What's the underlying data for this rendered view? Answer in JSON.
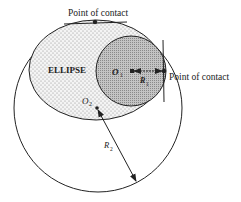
{
  "diagram": {
    "labels": {
      "top_contact": "Point of contact",
      "right_contact": "Point of contact",
      "ellipse": "ELLIPSE",
      "o1": "O",
      "o1_sub": "1",
      "r1": "R",
      "r1_sub": "1",
      "o2": "O",
      "o2_sub": "2",
      "r2": "R",
      "r2_sub": "2"
    },
    "colors": {
      "stroke": "#222222",
      "ellipse_fill": "#e8e8e8",
      "circle_fill": "#bdbdbd",
      "background": "#ffffff"
    }
  }
}
